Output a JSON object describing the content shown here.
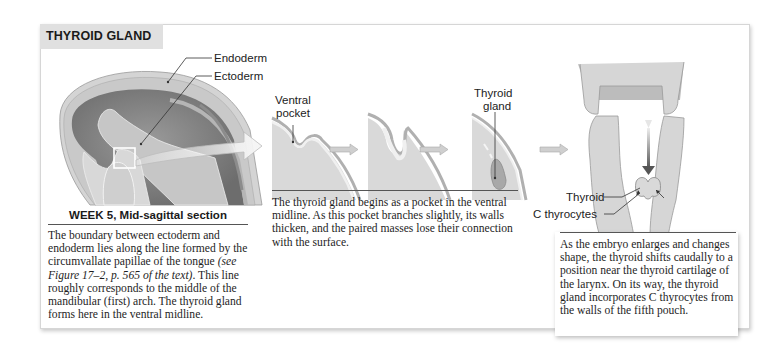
{
  "title": "THYROID GLAND",
  "panel_embryo": {
    "labels": {
      "endoderm": "Endoderm",
      "ectoderm": "Ectoderm"
    },
    "caption_heading": "WEEK 5, Mid-sagittal section",
    "caption_part1": "The boundary between ectoderm and endoderm lies along the line formed by the circumvallate papillae of the tongue",
    "caption_ref": "(see Figure 17–2, p. 565 of the text)",
    "caption_part2": ". This line roughly corresponds to the middle of the mandibular (first) arch. The thyroid gland forms here in the ventral midline."
  },
  "panel_pocket": {
    "labels": {
      "ventral_pocket_1": "Ventral",
      "ventral_pocket_2": "pocket",
      "thyroid_gland_1": "Thyroid",
      "thyroid_gland_2": "gland"
    },
    "caption": "The thyroid gland begins as a pocket in the ventral midline. As this pocket branches slightly, its walls thicken, and the paired masses lose their connection with the surface."
  },
  "panel_larynx": {
    "labels": {
      "thyroid": "Thyroid",
      "c_thyrocytes": "C thyrocytes"
    },
    "caption": "As the embryo enlarges and changes shape, the thyroid shifts caudally to a position near the thyroid cartilage of the larynx. On its way, the thyroid gland incorporates C thyrocytes from the walls of the fifth pouch."
  },
  "colors": {
    "title_bg": "#e0e0e0",
    "tissue_light": "#d9d9d9",
    "tissue_dark": "#7d7d7d",
    "gland": "#a8a8a8",
    "arrow_fill": "#cfcfcf"
  }
}
